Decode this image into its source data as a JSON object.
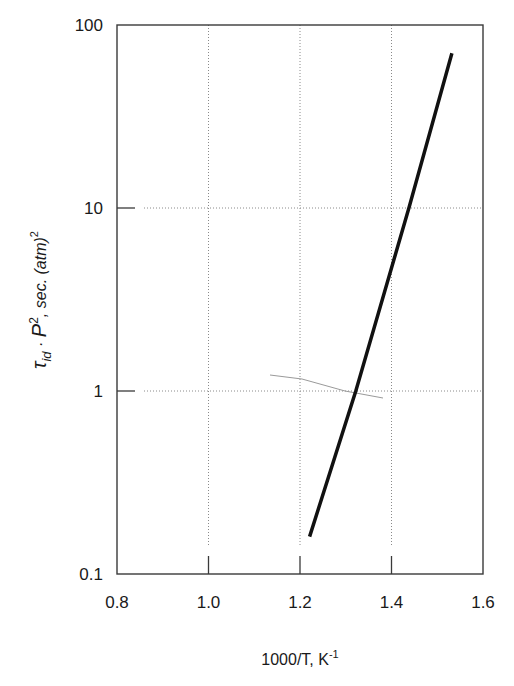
{
  "chart_data": {
    "type": "line",
    "title": "",
    "xlabel": "1000/T,  K⁻¹",
    "xlabel_main": "1000/T,  K",
    "xlabel_sup": "-1",
    "ylabel": "τ_id · P², sec. (atm)²",
    "ylabel_parts": {
      "tau": "τ",
      "tau_sub": "id",
      "dot": " · ",
      "p": "P",
      "p_sup": "2",
      "rest": ", sec. (atm)",
      "rest_sup": "2"
    },
    "xscale": "linear",
    "yscale": "log",
    "xlim": [
      0.8,
      1.6
    ],
    "ylim": [
      0.1,
      100
    ],
    "xticks": [
      0.8,
      1.0,
      1.2,
      1.4,
      1.6
    ],
    "xtick_labels": [
      "0.8",
      "1.0",
      "1.2",
      "1.4",
      "1.6"
    ],
    "yticks": [
      0.1,
      1,
      10,
      100
    ],
    "ytick_labels": [
      "0.1",
      "1",
      "10",
      "100"
    ],
    "grid": true,
    "grid_style": "dotted",
    "legend": null,
    "series": [
      {
        "name": "ignition delay correlation",
        "x": [
          1.221,
          1.322,
          1.438,
          1.532
        ],
        "y": [
          0.16,
          1.0,
          10.0,
          70.0
        ],
        "color": "#111111",
        "line_width": 3.5
      }
    ]
  }
}
